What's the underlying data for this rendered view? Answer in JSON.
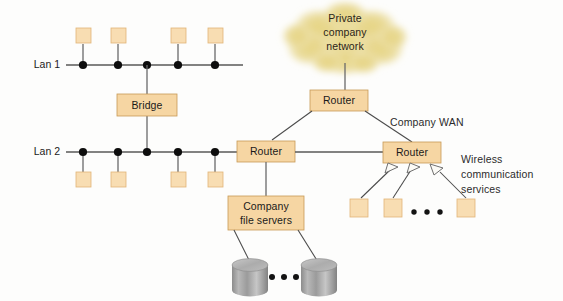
{
  "diagram": {
    "colors": {
      "box_fill": "#f6d6a3",
      "box_border": "#c79a56",
      "terminal_fill": "#f8ddb2",
      "cloud_fill": "#e8d98f",
      "line": "#595959",
      "node": "#0d0d0d",
      "disk_body": "#9a9a9a"
    },
    "labels": {
      "lan1": "Lan 1",
      "lan2": "Lan 2",
      "bridge": "Bridge",
      "router_top": "Router",
      "router_center": "Router",
      "router_right": "Router",
      "cloud": [
        "Private",
        "company",
        "network"
      ],
      "company_wan": "Company WAN",
      "wireless": [
        "Wireless",
        "communication",
        "services"
      ],
      "file_servers": [
        "Company",
        "file servers"
      ]
    },
    "ellipsis": {
      "wireless_glyph": "• • •",
      "disks_glyph": "• • •"
    },
    "counts": {
      "lan1_nodes": 5,
      "lan1_terminals": 4,
      "lan2_nodes": 5,
      "lan2_terminals": 4,
      "wireless_terminals": 3,
      "disks": 2
    },
    "nodes": {
      "lan1_dot_x": [
        83,
        118,
        147,
        178,
        215
      ],
      "lan2_dot_x": [
        83,
        118,
        147,
        178,
        215
      ],
      "lan1_y": 65,
      "lan2_y": 152,
      "lan1_terminal_x": [
        83,
        118,
        178,
        215
      ],
      "lan2_terminal_x": [
        83,
        118,
        178,
        215
      ],
      "wireless_terminal_x": [
        358,
        392,
        465
      ]
    }
  }
}
